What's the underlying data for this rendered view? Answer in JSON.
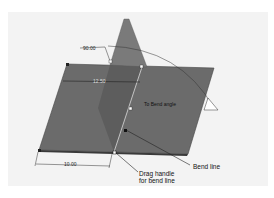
{
  "diagram": {
    "colors": {
      "viewport_bg": "#f3f3f3",
      "plate": "#6b6b6b",
      "plate_edge": "#3a3a3a",
      "flange": "#7a7a7a",
      "flange_overlap": "#5a5a5a",
      "handle": "#ffffff",
      "line": "#222222"
    },
    "dimensions": {
      "angle": "90.00",
      "offset": "12.50",
      "bottom_length": "10.00",
      "inline_note": "To Bend angle"
    },
    "callouts": {
      "bend_line": "Bend line",
      "drag_handle_line1": "Drag handle",
      "drag_handle_line2": "for bend line"
    }
  }
}
